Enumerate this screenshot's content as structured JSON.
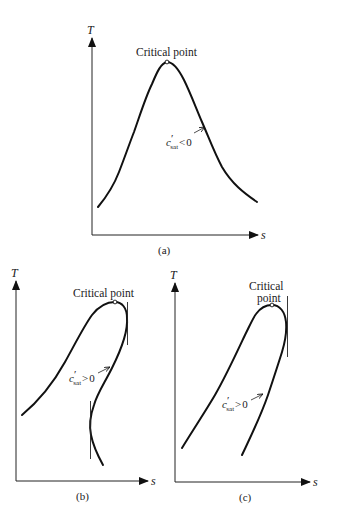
{
  "figure": {
    "panels": [
      {
        "id": "a",
        "caption": "(a)",
        "y_axis_label": "T",
        "x_axis_label": "s",
        "critical_point_label": "Critical point",
        "slope_label": {
          "c": "c",
          "prime": "′",
          "sub": "sat",
          "relation": "<",
          "value": "0"
        },
        "curve_shape": "bell (symmetric vapor dome)"
      },
      {
        "id": "b",
        "caption": "(b)",
        "y_axis_label": "T",
        "x_axis_label": "s",
        "critical_point_label": "Critical point",
        "slope_label": {
          "c": "c",
          "prime": "′",
          "sub": "sat",
          "relation": ">",
          "value": "0"
        },
        "curve_shape": "overhanging dome with S-shaped vapor line and two vertical tangents"
      },
      {
        "id": "c",
        "caption": "(c)",
        "y_axis_label": "T",
        "x_axis_label": "s",
        "critical_point_label_line1": "Critical",
        "critical_point_label_line2": "point",
        "slope_label": {
          "c": "c",
          "prime": "′",
          "sub": "sat",
          "relation": ">",
          "value": "0"
        },
        "curve_shape": "skewed dome with positive-slope vapor line and one vertical tangent"
      }
    ],
    "colors": {
      "ink": "#111111",
      "background": "#ffffff"
    }
  }
}
